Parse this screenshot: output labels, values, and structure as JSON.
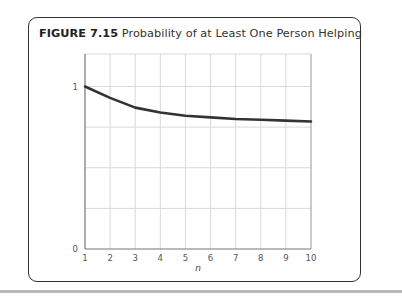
{
  "figure": {
    "label": "FIGURE 7.15",
    "caption": "Probability of at Least One Person Helping"
  },
  "chart_data": {
    "type": "line",
    "title": "Probability of at Least One Person Helping",
    "xlabel": "n",
    "ylabel": "",
    "x": [
      1,
      2,
      3,
      4,
      5,
      6,
      7,
      8,
      9,
      10
    ],
    "series": [
      {
        "name": "P(at least one helps)",
        "values": [
          1.0,
          0.93,
          0.87,
          0.84,
          0.82,
          0.81,
          0.8,
          0.795,
          0.79,
          0.785
        ]
      }
    ],
    "xlim": [
      1,
      10
    ],
    "ylim": [
      0,
      1.2
    ],
    "xticks": [
      1,
      2,
      3,
      4,
      5,
      6,
      7,
      8,
      9,
      10
    ],
    "yticks_labeled": [
      0,
      1
    ],
    "ygrid": [
      0.25,
      0.5,
      0.75,
      1.0
    ],
    "grid": true,
    "legend": "none",
    "colors": {
      "line": "#333333",
      "grid": "#d9d9d9",
      "axis": "#777777"
    }
  }
}
